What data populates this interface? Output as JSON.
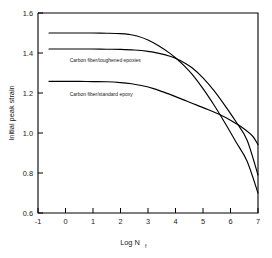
{
  "chart_data": {
    "type": "line",
    "title": "",
    "xlabel": "Log N",
    "xlabel_sub": "f",
    "ylabel": "Initial peak strain",
    "xlim": [
      -1,
      7
    ],
    "ylim": [
      0.6,
      1.6
    ],
    "xticks": [
      -1,
      0,
      1,
      2,
      3,
      4,
      5,
      6,
      7
    ],
    "xtick_labels": [
      "-1",
      "0",
      "1",
      "2",
      "3",
      "4",
      "5",
      "6",
      "7"
    ],
    "yticks": [
      0.6,
      0.8,
      1.0,
      1.2,
      1.4,
      1.6
    ],
    "ytick_labels": [
      "0.6",
      "0.8",
      "1.0",
      "1.2",
      "1.4",
      "1.6"
    ],
    "grid": false,
    "legend": "none",
    "line_color": "#000000",
    "frame_color": "#000000",
    "background": "#ffffff",
    "series": [
      {
        "name": "upper-plateau-curve",
        "plateau": 1.5,
        "end_value": 0.7,
        "x": [
          -0.6,
          0.0,
          0.5,
          1.0,
          1.5,
          2.0,
          2.3,
          2.6,
          3.0,
          3.4,
          3.8,
          4.0,
          4.3,
          4.6,
          5.0,
          5.4,
          5.8,
          6.2,
          6.6,
          7.0
        ],
        "y": [
          1.5,
          1.5,
          1.5,
          1.5,
          1.499,
          1.497,
          1.493,
          1.485,
          1.465,
          1.435,
          1.398,
          1.376,
          1.338,
          1.294,
          1.222,
          1.14,
          1.05,
          0.955,
          0.86,
          0.7
        ]
      },
      {
        "name": "middle-plateau-curve",
        "plateau": 1.42,
        "end_value": 0.79,
        "x": [
          -0.6,
          0.0,
          0.5,
          1.0,
          1.5,
          2.0,
          2.5,
          3.0,
          3.4,
          3.8,
          4.0,
          4.3,
          4.6,
          5.0,
          5.4,
          5.8,
          6.2,
          6.6,
          7.0
        ],
        "y": [
          1.42,
          1.42,
          1.42,
          1.42,
          1.419,
          1.418,
          1.415,
          1.408,
          1.398,
          1.384,
          1.374,
          1.353,
          1.326,
          1.276,
          1.212,
          1.137,
          1.056,
          0.965,
          0.79
        ]
      },
      {
        "name": "lower-plateau-curve",
        "plateau": 1.26,
        "end_value": 0.94,
        "x": [
          -0.6,
          0.0,
          0.5,
          1.0,
          1.5,
          2.0,
          2.4,
          2.8,
          3.2,
          3.6,
          4.0,
          4.4,
          4.8,
          5.2,
          5.6,
          6.0,
          6.4,
          6.8,
          7.0
        ],
        "y": [
          1.258,
          1.258,
          1.258,
          1.257,
          1.256,
          1.252,
          1.246,
          1.236,
          1.222,
          1.203,
          1.182,
          1.16,
          1.138,
          1.116,
          1.092,
          1.064,
          1.03,
          0.985,
          0.942
        ]
      }
    ],
    "annotations": [
      {
        "name": "toughened-epoxies-label",
        "text": "Carbon fiber/toughened epoxies",
        "x": 0.15,
        "y": 1.355
      },
      {
        "name": "standard-epoxy-label",
        "text": "Carbon fiber/standard epoxy",
        "x": 0.15,
        "y": 1.185
      }
    ]
  }
}
